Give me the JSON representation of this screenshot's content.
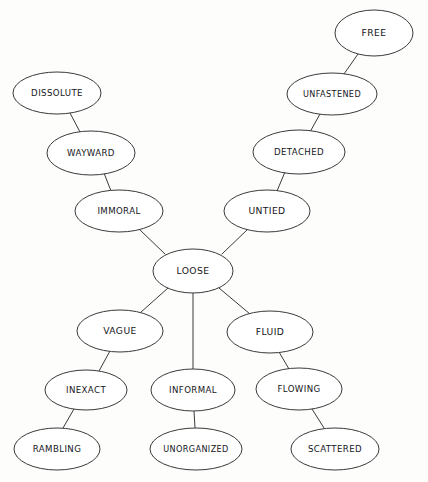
{
  "diagram": {
    "style": "hand-drawn concept map, white ellipses with thin dark outlines on off-white background",
    "background_color": "#fdfdfc",
    "node_fill": "#ffffff",
    "node_stroke": "#3a3a3a",
    "text_color": "#15151a",
    "nodes": [
      {
        "id": "free",
        "label": "FREE",
        "cx": 374,
        "cy": 33,
        "rx": 39,
        "ry": 23,
        "font": "sz-11"
      },
      {
        "id": "unfastened",
        "label": "UNFASTENED",
        "cx": 332,
        "cy": 94,
        "rx": 45,
        "ry": 21,
        "font": "sz-9"
      },
      {
        "id": "detached",
        "label": "DETACHED",
        "cx": 299,
        "cy": 152,
        "rx": 46,
        "ry": 22,
        "font": "sz-10"
      },
      {
        "id": "untied",
        "label": "UNTIED",
        "cx": 267,
        "cy": 211,
        "rx": 43,
        "ry": 21,
        "font": "sz-11"
      },
      {
        "id": "dissolute",
        "label": "DISSOLUTE",
        "cx": 57,
        "cy": 93,
        "rx": 44,
        "ry": 21,
        "font": "sz-10"
      },
      {
        "id": "wayward",
        "label": "WAYWARD",
        "cx": 91,
        "cy": 153,
        "rx": 44,
        "ry": 22,
        "font": "sz-10"
      },
      {
        "id": "immoral",
        "label": "IMMORAL",
        "cx": 119,
        "cy": 211,
        "rx": 44,
        "ry": 21,
        "font": "sz-10"
      },
      {
        "id": "loose",
        "label": "LOOSE",
        "cx": 193,
        "cy": 271,
        "rx": 40,
        "ry": 22,
        "font": "sz-11"
      },
      {
        "id": "vague",
        "label": "VAGUE",
        "cx": 120,
        "cy": 331,
        "rx": 43,
        "ry": 21,
        "font": "sz-11"
      },
      {
        "id": "fluid",
        "label": "FLUID",
        "cx": 270,
        "cy": 332,
        "rx": 43,
        "ry": 21,
        "font": "sz-11"
      },
      {
        "id": "inexact",
        "label": "INEXACT",
        "cx": 86,
        "cy": 390,
        "rx": 41,
        "ry": 20,
        "font": "sz-10"
      },
      {
        "id": "informal",
        "label": "INFORMAL",
        "cx": 193,
        "cy": 390,
        "rx": 42,
        "ry": 21,
        "font": "sz-10"
      },
      {
        "id": "flowing",
        "label": "FLOWING",
        "cx": 299,
        "cy": 389,
        "rx": 43,
        "ry": 21,
        "font": "sz-10"
      },
      {
        "id": "rambling",
        "label": "RAMBLING",
        "cx": 57,
        "cy": 449,
        "rx": 43,
        "ry": 21,
        "font": "sz-10"
      },
      {
        "id": "unorganized",
        "label": "UNORGANIZED",
        "cx": 196,
        "cy": 449,
        "rx": 46,
        "ry": 21,
        "font": "sz-9"
      },
      {
        "id": "scattered",
        "label": "SCATTERED",
        "cx": 335,
        "cy": 449,
        "rx": 44,
        "ry": 21,
        "font": "sz-10"
      }
    ],
    "edges": [
      {
        "id": "edge-free-unfastened",
        "from": "free",
        "to": "unfastened",
        "x1": 358,
        "y1": 54,
        "x2": 344,
        "y2": 74
      },
      {
        "id": "edge-unfastened-detached",
        "from": "unfastened",
        "to": "detached",
        "x1": 320,
        "y1": 114,
        "x2": 310,
        "y2": 132
      },
      {
        "id": "edge-detached-untied",
        "from": "detached",
        "to": "untied",
        "x1": 285,
        "y1": 172,
        "x2": 277,
        "y2": 191
      },
      {
        "id": "edge-untied-loose",
        "from": "untied",
        "to": "loose",
        "x1": 248,
        "y1": 229,
        "x2": 222,
        "y2": 254
      },
      {
        "id": "edge-dissolute-wayward",
        "from": "dissolute",
        "to": "wayward",
        "x1": 70,
        "y1": 113,
        "x2": 80,
        "y2": 132
      },
      {
        "id": "edge-wayward-immoral",
        "from": "wayward",
        "to": "immoral",
        "x1": 104,
        "y1": 173,
        "x2": 111,
        "y2": 191
      },
      {
        "id": "edge-immoral-loose",
        "from": "immoral",
        "to": "loose",
        "x1": 139,
        "y1": 229,
        "x2": 165,
        "y2": 254
      },
      {
        "id": "edge-loose-vague",
        "from": "loose",
        "to": "vague",
        "x1": 168,
        "y1": 288,
        "x2": 140,
        "y2": 313
      },
      {
        "id": "edge-loose-informal",
        "from": "loose",
        "to": "informal",
        "x1": 193,
        "y1": 293,
        "x2": 193,
        "y2": 369
      },
      {
        "id": "edge-loose-fluid",
        "from": "loose",
        "to": "fluid",
        "x1": 219,
        "y1": 288,
        "x2": 250,
        "y2": 314
      },
      {
        "id": "edge-vague-inexact",
        "from": "vague",
        "to": "inexact",
        "x1": 110,
        "y1": 351,
        "x2": 99,
        "y2": 371
      },
      {
        "id": "edge-fluid-flowing",
        "from": "fluid",
        "to": "flowing",
        "x1": 279,
        "y1": 352,
        "x2": 289,
        "y2": 369
      },
      {
        "id": "edge-inexact-rambling",
        "from": "inexact",
        "to": "rambling",
        "x1": 74,
        "y1": 409,
        "x2": 63,
        "y2": 428
      },
      {
        "id": "edge-informal-unorganized",
        "from": "informal",
        "to": "unorganized",
        "x1": 194,
        "y1": 411,
        "x2": 195,
        "y2": 428
      },
      {
        "id": "edge-flowing-scattered",
        "from": "flowing",
        "to": "scattered",
        "x1": 312,
        "y1": 409,
        "x2": 324,
        "y2": 428
      }
    ]
  }
}
